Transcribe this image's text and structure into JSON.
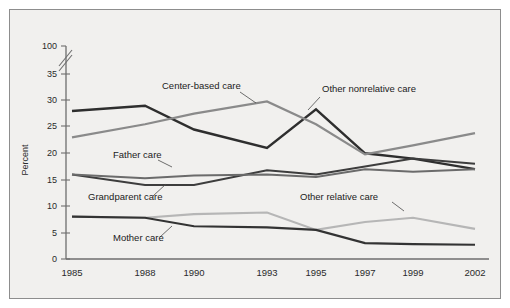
{
  "chart_data": {
    "type": "line",
    "title": "",
    "xlabel": "",
    "ylabel": "Percent",
    "categories": [
      "1985",
      "1988",
      "1990",
      "1993",
      "1995",
      "1997",
      "1999",
      "2002"
    ],
    "x": [
      1985,
      1988,
      1990,
      1993,
      1995,
      1997,
      1999,
      2002
    ],
    "ylim": [
      0,
      35
    ],
    "axis_break": "Axis broken between 35 and 100",
    "ytick_labels": [
      "0",
      "5",
      "10",
      "15",
      "20",
      "25",
      "30",
      "35",
      "100"
    ],
    "ytick_values": [
      0,
      5,
      10,
      15,
      20,
      25,
      30,
      35,
      100
    ],
    "grid": false,
    "legend": "inline annotations on plot",
    "series": [
      {
        "name": "Mother care",
        "color": "#2e2e2e",
        "values": [
          28.0,
          29.0,
          24.5,
          21.0,
          28.3,
          20.0,
          19.0,
          17.0
        ]
      },
      {
        "name": "Center-based care",
        "color": "#8a8a8a",
        "values": [
          23.0,
          25.5,
          27.5,
          29.8,
          25.5,
          19.8,
          21.5,
          23.8
        ]
      },
      {
        "name": "Father care",
        "color": "#3d3d3d",
        "values": [
          16.0,
          14.0,
          14.0,
          16.8,
          16.0,
          17.5,
          19.0,
          18.0
        ]
      },
      {
        "name": "Grandparent care",
        "color": "#6b6b6b",
        "values": [
          16.0,
          15.3,
          15.8,
          16.0,
          15.5,
          17.0,
          16.5,
          17.0
        ]
      },
      {
        "name": "Other relative care",
        "color": "#b6b6b6",
        "values": [
          8.0,
          7.8,
          8.5,
          8.8,
          5.5,
          7.0,
          7.8,
          5.7
        ]
      },
      {
        "name": "Other nonrelative care",
        "color": "#333333",
        "values": [
          8.0,
          7.8,
          6.2,
          6.0,
          5.5,
          3.0,
          2.8,
          2.7
        ]
      }
    ],
    "annotations": [
      {
        "text": "Center-based care",
        "x": 162,
        "y": 89
      },
      {
        "text": "Other nonrelative care",
        "x": 322,
        "y": 92
      },
      {
        "text": "Father care",
        "x": 113,
        "y": 158
      },
      {
        "text": "Grandparent care",
        "x": 88,
        "y": 200
      },
      {
        "text": "Other relative care",
        "x": 300,
        "y": 200
      },
      {
        "text": "Mother care",
        "x": 113,
        "y": 241
      }
    ]
  },
  "axis": {
    "y_title": "Percent",
    "y_labels": [
      "100",
      "35",
      "30",
      "25",
      "20",
      "15",
      "10",
      "5",
      "0"
    ],
    "x_labels": [
      "1985",
      "1988",
      "1990",
      "1993",
      "1995",
      "1997",
      "1999",
      "2002"
    ]
  },
  "colors": {
    "background": "#f1f0ee",
    "page": "#ffffff",
    "frame_border": "#8d8d8d",
    "axis": "#6e6e6e",
    "text": "#2a2a2a"
  }
}
